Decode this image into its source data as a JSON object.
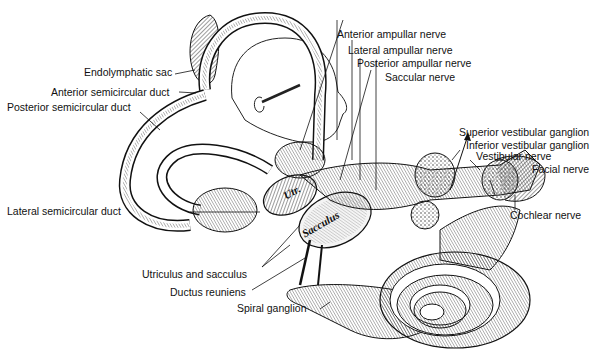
{
  "figure": {
    "orientation_inset": "head profile facing right"
  },
  "labels": {
    "endolymphatic_sac": "Endolymphatic sac",
    "anterior_semicircular_duct": "Anterior semicircular duct",
    "posterior_semicircular_duct": "Posterior semicircular duct",
    "lateral_semicircular_duct": "Lateral semicircular duct",
    "anterior_ampullar_nerve": "Anterior ampullar nerve",
    "lateral_ampullar_nerve": "Lateral ampullar nerve",
    "posterior_ampullar_nerve": "Posterior ampullar nerve",
    "saccular_nerve": "Saccular nerve",
    "superior_vestibular_ganglion": "Superior vestibular ganglion",
    "inferior_vestibular_ganglion": "Inferior vestibular ganglion",
    "vestibular_nerve": "Vestibular nerve",
    "facial_nerve": "Facial nerve",
    "cochlear_nerve": "Cochlear nerve",
    "utriculus_and_sacculus": "Utriculus and sacculus",
    "ductus_reuniens": "Ductus reuniens",
    "spiral_ganglion": "Spiral ganglion"
  },
  "inner_labels": {
    "utr": "Utr.",
    "sacculus": "Sacculus"
  }
}
